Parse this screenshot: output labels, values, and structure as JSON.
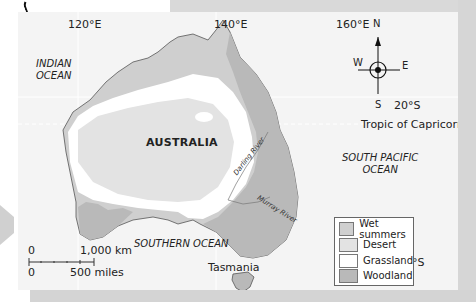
{
  "map": {
    "title_region": "AUSTRALIA",
    "longitude_labels": [
      "120°E",
      "140°E",
      "160°E"
    ],
    "latitude_labels": [
      "20°S",
      "40°S"
    ],
    "tropic_label": "Tropic of Capricorn",
    "oceans": {
      "indian_line1": "INDIAN",
      "indian_line2": "OCEAN",
      "south_pacific_line1": "SOUTH PACIFIC",
      "south_pacific_line2": "OCEAN",
      "southern": "SOUTHERN OCEAN"
    },
    "rivers": [
      "Darling River",
      "Murray River"
    ],
    "island": "Tasmania",
    "compass": {
      "n": "N",
      "s": "S",
      "e": "E",
      "w": "W"
    },
    "scale": {
      "km_zero": "0",
      "km_label": "1,000 km",
      "mi_zero": "0",
      "mi_label": "500 miles"
    }
  },
  "legend": {
    "items": [
      {
        "label": "Wet summers",
        "color": "#cfcfcf"
      },
      {
        "label": "Desert",
        "color": "#e3e3e3"
      },
      {
        "label": "Grassland",
        "color": "#ffffff"
      },
      {
        "label": "Woodland",
        "color": "#b9b9b9"
      }
    ]
  },
  "colors": {
    "ocean": "#f4f4f4",
    "wet_summers": "#cfcfcf",
    "desert": "#e3e3e3",
    "grassland": "#ffffff",
    "woodland": "#b9b9b9",
    "coastline": "#555555"
  }
}
